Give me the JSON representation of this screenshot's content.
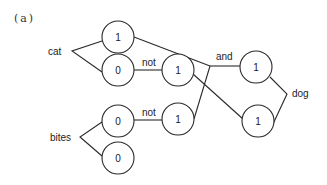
{
  "figure": {
    "caption": "(a)"
  },
  "labels": {
    "cat": "cat",
    "bites": "bites",
    "not_top": "not",
    "not_bottom": "not",
    "and": "and",
    "dog": "dog"
  },
  "nodes": {
    "cat_1": "1",
    "cat_0": "0",
    "not_cat": "1",
    "and_node": "1",
    "bites_0_top": "0",
    "bites_0_bottom": "0",
    "not_bites": "1",
    "lower_right": "1"
  }
}
